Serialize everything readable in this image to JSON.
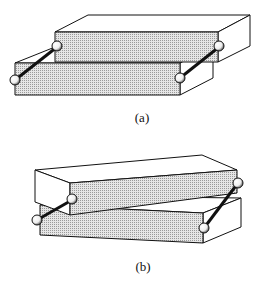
{
  "figures": [
    {
      "id": "a",
      "caption": "(a)",
      "description": "Two stacked rectangular blocks, offset horizontally, connected by two rods with ball joints on each side",
      "caption_pos": {
        "x": 142,
        "y": 110
      }
    },
    {
      "id": "b",
      "caption": "(b)",
      "description": "Two stacked rectangular blocks, rotated relative to each other, connected by two rods with ball joints on each side",
      "caption_pos": {
        "x": 143,
        "y": 259
      }
    }
  ],
  "colors": {
    "line": "#111111",
    "face_shaded": "#d4d4d4",
    "face_white": "#ffffff",
    "ball": "#f2f2f2"
  }
}
